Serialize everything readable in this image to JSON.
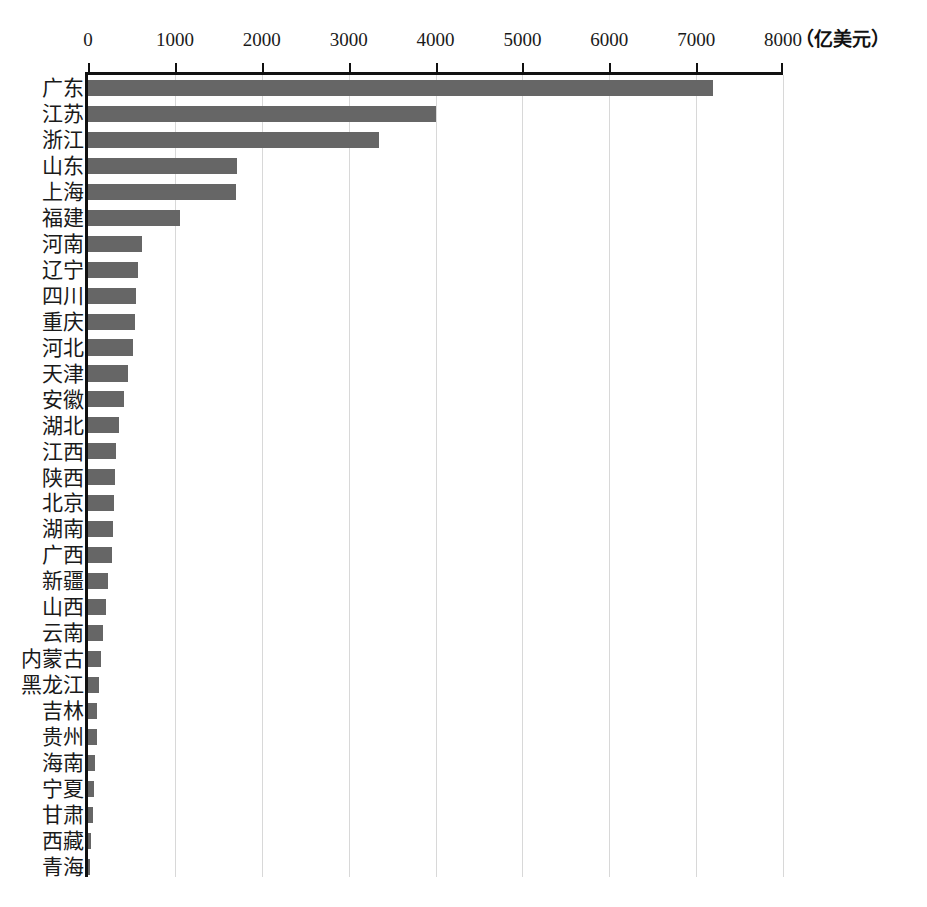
{
  "chart_data": {
    "type": "bar",
    "orientation": "horizontal",
    "title": "",
    "subtitle": "",
    "xlabel": "",
    "ylabel": "",
    "unit_label": "（亿美元）",
    "xlim": [
      0,
      8000
    ],
    "x_ticks": [
      0,
      1000,
      2000,
      3000,
      4000,
      5000,
      6000,
      7000,
      8000
    ],
    "x_tick_labels": [
      "0",
      "1000",
      "2000",
      "3000",
      "4000",
      "5000",
      "6000",
      "7000",
      "8000"
    ],
    "grid": true,
    "grid_axis": "x",
    "legend": false,
    "bar_color": "#666666",
    "categories": [
      "广东",
      "江苏",
      "浙江",
      "山东",
      "上海",
      "福建",
      "河南",
      "辽宁",
      "四川",
      "重庆",
      "河北",
      "天津",
      "安徽",
      "湖北",
      "江西",
      "陕西",
      "北京",
      "湖南",
      "广西",
      "新疆",
      "山西",
      "云南",
      "内蒙古",
      "黑龙江",
      "吉林",
      "贵州",
      "海南",
      "宁夏",
      "甘肃",
      "西藏",
      "青海"
    ],
    "values": [
      7190,
      4000,
      3350,
      1720,
      1700,
      1060,
      620,
      570,
      550,
      545,
      520,
      455,
      415,
      360,
      320,
      310,
      295,
      285,
      280,
      230,
      210,
      175,
      150,
      130,
      105,
      100,
      85,
      70,
      55,
      40,
      15
    ]
  }
}
